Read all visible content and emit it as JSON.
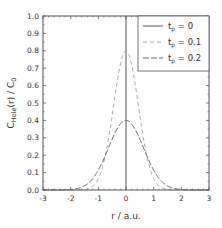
{
  "chart_data": {
    "type": "line",
    "title": "",
    "xlabel": "r / a.u.",
    "ylabel": {
      "main": "C",
      "sub": "Hole",
      "rest": "(r) / C",
      "sub2": "0"
    },
    "xlim": [
      -3,
      3
    ],
    "ylim": [
      0,
      1.0
    ],
    "xticks": [
      -3,
      -2,
      -1,
      0,
      1,
      2,
      3
    ],
    "xtick_labels": [
      "-3",
      "-2",
      "-1",
      "0",
      "1",
      "2",
      "3"
    ],
    "yticks": [
      0.0,
      0.1,
      0.2,
      0.3,
      0.4,
      0.5,
      0.6,
      0.7,
      0.8,
      0.9,
      1.0
    ],
    "ytick_labels": [
      "0.0",
      "0.1",
      "0.2",
      "0.3",
      "0.4",
      "0.5",
      "0.6",
      "0.7",
      "0.8",
      "0.9",
      "1.0"
    ],
    "grid": false,
    "legend_position": "top-right",
    "series": [
      {
        "name": "t_p = 0",
        "label_main": "t",
        "label_sub": "p",
        "label_rest": " = 0",
        "style": "solid",
        "color": "#555555",
        "kind": "delta",
        "x": 0
      },
      {
        "name": "t_p = 0.1",
        "label_main": "t",
        "label_sub": "p",
        "label_rest": " = 0.1",
        "style": "dashed-short",
        "color": "#aaaaaa",
        "kind": "gaussian",
        "peak": 0.8,
        "sigma": 0.447
      },
      {
        "name": "t_p = 0.2",
        "label_main": "t",
        "label_sub": "p",
        "label_rest": " = 0.2",
        "style": "dashed-long",
        "color": "#666666",
        "kind": "gaussian",
        "peak": 0.4,
        "sigma": 0.632
      }
    ]
  }
}
